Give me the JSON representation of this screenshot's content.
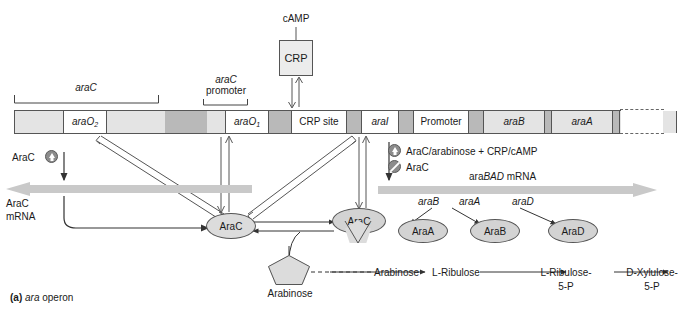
{
  "figure": {
    "caption_tag": "(a)",
    "caption_italic": "ara",
    "caption_rest": " operon"
  },
  "top": {
    "camp_label": "cAMP",
    "crp_label": "CRP"
  },
  "brackets": {
    "arac_gene": "araC",
    "arac_promoter_line1": "araC",
    "arac_promoter_line2": "promoter"
  },
  "dna_segments": [
    {
      "name": "spacer-left",
      "label": "",
      "type": "light",
      "left": 0,
      "width": 48
    },
    {
      "name": "araO2",
      "label": "araO",
      "sub": "2",
      "type": "white",
      "left": 48,
      "width": 44
    },
    {
      "name": "spacer-2",
      "label": "",
      "type": "light",
      "left": 92,
      "width": 58
    },
    {
      "name": "spacer-3",
      "label": "",
      "type": "dark",
      "left": 150,
      "width": 42
    },
    {
      "name": "spacer-4",
      "label": "",
      "type": "light",
      "left": 192,
      "width": 18
    },
    {
      "name": "araO1",
      "label": "araO",
      "sub": "1",
      "type": "white",
      "left": 210,
      "width": 44
    },
    {
      "name": "spacer-5",
      "label": "",
      "type": "dark",
      "left": 254,
      "width": 22
    },
    {
      "name": "crp-site",
      "label": "CRP site",
      "type": "white",
      "left": 276,
      "width": 56
    },
    {
      "name": "spacer-6",
      "label": "",
      "type": "dark",
      "left": 332,
      "width": 14
    },
    {
      "name": "araI",
      "label": "araI",
      "type": "white",
      "left": 346,
      "width": 38
    },
    {
      "name": "spacer-7",
      "label": "",
      "type": "dark",
      "left": 384,
      "width": 14
    },
    {
      "name": "promoter",
      "label": "Promoter",
      "type": "white",
      "left": 398,
      "width": 56
    },
    {
      "name": "spacer-8",
      "label": "",
      "type": "dark",
      "left": 454,
      "width": 14
    },
    {
      "name": "araB",
      "label": "araB",
      "type": "gene",
      "left": 468,
      "width": 62
    },
    {
      "name": "spacer-9",
      "label": "",
      "type": "dark",
      "left": 530,
      "width": 6
    },
    {
      "name": "araA",
      "label": "araA",
      "type": "gene",
      "left": 536,
      "width": 62
    },
    {
      "name": "spacer-10",
      "label": "",
      "type": "dark",
      "left": 598,
      "width": 6
    },
    {
      "name": "araD",
      "label": "araD",
      "type": "gene",
      "left": 604,
      "width": 58
    }
  ],
  "left_panel": {
    "arac_regulator": "AraC",
    "arac_mrna_line1": "AraC",
    "arac_mrna_line2": "mRNA"
  },
  "legend": {
    "activation": "AraC/arabinose + CRP/cAMP",
    "repression": "AraC",
    "mrna_prefix": "ara",
    "mrna_italic": "BAD",
    "mrna_suffix": " mRNA"
  },
  "proteins": {
    "arac": "AraC",
    "arac_bound": "AraC",
    "araA": "AraA",
    "araB": "AraB",
    "araD": "AraD"
  },
  "gene_arrows": [
    {
      "name": "araB-label",
      "label": "araB"
    },
    {
      "name": "araA-label",
      "label": "araA"
    },
    {
      "name": "araD-label",
      "label": "araD"
    }
  ],
  "arabinose": {
    "shape_label": "Arabinose",
    "node_label": "Arabinose"
  },
  "pathway": [
    {
      "name": "l-ribulose",
      "line1": "L-Ribulose",
      "line2": ""
    },
    {
      "name": "l-ribulose-5p",
      "line1": "L-Ribulose-",
      "line2": "5-P"
    },
    {
      "name": "d-xylulose-5p",
      "line1": "D-Xylulose-",
      "line2": "5-P"
    }
  ],
  "colors": {
    "bar_light": "#e4e4e4",
    "bar_dark": "#b9b9b9",
    "oval_fill": "#d3d3d3",
    "thick_arrow": "#c9c9c9",
    "stroke": "#555555"
  }
}
